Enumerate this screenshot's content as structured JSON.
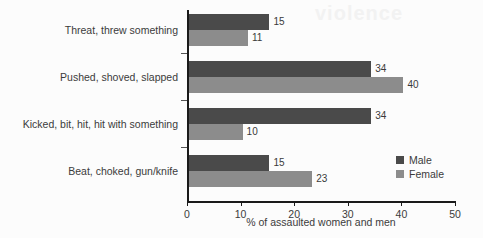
{
  "chart_data": {
    "type": "bar",
    "orientation": "horizontal",
    "title": "",
    "subtitle": "",
    "xlabel": "% of assaulted women and men",
    "ylabel": "",
    "xlim": [
      0,
      50
    ],
    "xticks": [
      0,
      10,
      20,
      30,
      40,
      50
    ],
    "xtick_labels": [
      "0",
      "10",
      "20",
      "30",
      "40",
      "50"
    ],
    "grid": false,
    "legend_position": "right-inside",
    "categories": [
      "Threat, threw something",
      "Pushed, shoved, slapped",
      "Kicked, bit, hit, hit with something",
      "Beat, choked, gun/knife"
    ],
    "series": [
      {
        "name": "Male",
        "color": "#4a4a4a",
        "values": [
          15,
          34,
          34,
          15
        ],
        "value_labels": [
          "15",
          "34",
          "34",
          "15"
        ]
      },
      {
        "name": "Female",
        "color": "#8c8c8c",
        "values": [
          11,
          40,
          10,
          23
        ],
        "value_labels": [
          "11",
          "40",
          "10",
          "23"
        ]
      }
    ]
  },
  "legend": {
    "entries": [
      {
        "label": "Male",
        "color": "#4a4a4a"
      },
      {
        "label": "Female",
        "color": "#8c8c8c"
      }
    ]
  },
  "axes": {
    "x_title": "% of assaulted women and men",
    "x_tick_labels": [
      "0",
      "10",
      "20",
      "30",
      "40",
      "50"
    ]
  },
  "watermark": {
    "text": "violence"
  },
  "colors": {
    "male_bar": "#4a4a4a",
    "female_bar": "#8c8c8c",
    "axis": "#1a1a1a",
    "text": "#3b3b3b",
    "background": "#fcfcfc"
  }
}
